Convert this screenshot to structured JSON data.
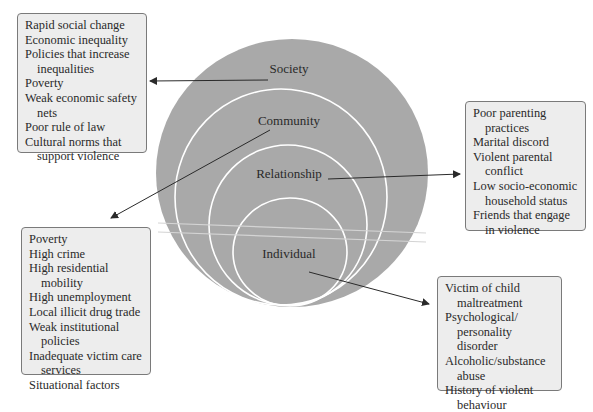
{
  "diagram": {
    "type": "nested-circles",
    "colors": {
      "circle_fill": "#a9a9a9",
      "ring_stroke": "#ffffff",
      "box_fill": "#ededed",
      "box_border": "#7a7a7a",
      "arrow": "#2a2a2a"
    },
    "levels": [
      {
        "label": "Society",
        "factors": [
          "Rapid social change",
          "Economic inequality",
          "Policies that increase inequalities",
          "Poverty",
          "Weak economic safety nets",
          "Poor rule of law",
          "Cultural norms that support violence"
        ]
      },
      {
        "label": "Community",
        "factors": [
          "Poverty",
          "High crime",
          "High residential mobility",
          "High unemployment",
          "Local illicit drug trade",
          "Weak institutional policies",
          "Inadequate victim care services",
          "Situational factors"
        ]
      },
      {
        "label": "Relationship",
        "factors": [
          "Poor parenting practices",
          "Marital discord",
          "Violent parental conflict",
          "Low socio-economic household status",
          "Friends that engage in violence"
        ]
      },
      {
        "label": "Individual",
        "factors": [
          "Victim of child maltreatment",
          "Psychological/ personality disorder",
          "Alcoholic/substance abuse",
          "History of violent behaviour"
        ]
      }
    ]
  }
}
